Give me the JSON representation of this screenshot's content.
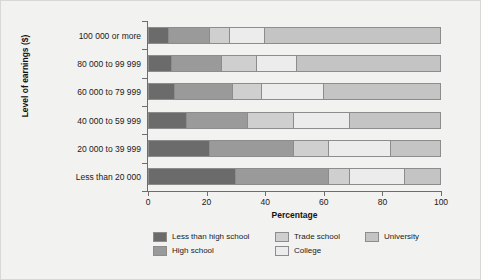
{
  "chart_data": {
    "type": "bar",
    "orientation": "horizontal",
    "stacked": true,
    "stack_normalized_percent": true,
    "title": "",
    "xlabel": "Percentage",
    "ylabel": "Level of earnings ($)",
    "xlim": [
      0,
      100
    ],
    "xticks": [
      0,
      20,
      40,
      60,
      80,
      100
    ],
    "xtick_labels": [
      "0",
      "20",
      "40",
      "60",
      "80",
      "100"
    ],
    "grid": false,
    "legend_position": "bottom",
    "categories": [
      "100 000 or more",
      "80 000 to 99 999",
      "60 000 to 79 999",
      "40 000 to 59 999",
      "20 000 to 39 999",
      "Less than 20 000"
    ],
    "series": [
      {
        "name": "Less than high school",
        "color": "#6b6b6b",
        "values": [
          7,
          8,
          9,
          13,
          21,
          30
        ]
      },
      {
        "name": "High school",
        "color": "#9a9a9a",
        "values": [
          14,
          17,
          20,
          21,
          29,
          32
        ]
      },
      {
        "name": "Trade school",
        "color": "#cfcfcf",
        "values": [
          7,
          12,
          10,
          16,
          12,
          7
        ]
      },
      {
        "name": "College",
        "color": "#ececec",
        "values": [
          12,
          14,
          21,
          19,
          21,
          19
        ]
      },
      {
        "name": "University",
        "color": "#c4c4c4",
        "values": [
          60,
          49,
          40,
          31,
          17,
          12
        ]
      }
    ],
    "cumulative_boundaries": [
      [
        7,
        21,
        28,
        40,
        100
      ],
      [
        8,
        25,
        37,
        51,
        100
      ],
      [
        9,
        29,
        39,
        60,
        100
      ],
      [
        13,
        34,
        50,
        69,
        100
      ],
      [
        21,
        50,
        62,
        83,
        100
      ],
      [
        30,
        62,
        69,
        88,
        100
      ]
    ]
  },
  "legend": {
    "items": [
      {
        "label": "Less than high school",
        "color": "#6b6b6b"
      },
      {
        "label": "High school",
        "color": "#9a9a9a"
      },
      {
        "label": "Trade school",
        "color": "#cfcfcf"
      },
      {
        "label": "College",
        "color": "#ececec"
      },
      {
        "label": "University",
        "color": "#c4c4c4"
      }
    ]
  },
  "axes": {
    "x_title": "Percentage",
    "y_title": "Level of earnings ($)",
    "x_tick_labels": [
      "0",
      "20",
      "40",
      "60",
      "80",
      "100"
    ],
    "y_tick_labels": [
      "100 000 or more",
      "80 000 to 99 999",
      "60 000 to 79 999",
      "40 000 to 59 999",
      "20 000 to 39 999",
      "Less than 20 000"
    ]
  },
  "colors": {
    "background": "#f2f2f0",
    "frame": "#d8d8d4",
    "axis": "#6d6d6d",
    "bar_outline": "#8c8c8c",
    "text": "#1a1a1a"
  }
}
